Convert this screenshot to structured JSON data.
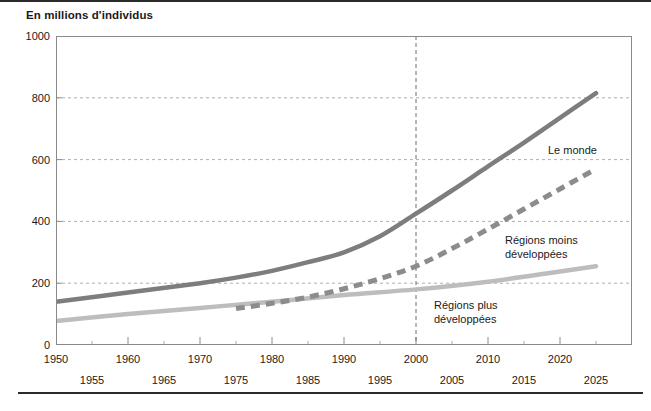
{
  "chart_data": {
    "type": "line",
    "title": "En millions d'individus",
    "xlabel": "",
    "ylabel": "",
    "xlim": [
      1950,
      2030
    ],
    "ylim": [
      0,
      1000
    ],
    "grid": true,
    "legend_position": "inline-annotations",
    "yticks": [
      0,
      200,
      400,
      600,
      800,
      1000
    ],
    "xticks_row_a": [
      1950,
      1960,
      1970,
      1980,
      1990,
      2000,
      2010,
      2020
    ],
    "xticks_row_b": [
      1955,
      1965,
      1975,
      1985,
      1995,
      2005,
      2015,
      2025
    ],
    "annotations": [
      {
        "text": "projection reference year",
        "x": 2000,
        "style": "vertical-dashed"
      }
    ],
    "series": [
      {
        "name": "Le monde",
        "label": "Le monde",
        "style": "solid",
        "color": "#7d7d7d",
        "x": [
          1950,
          1960,
          1970,
          1975,
          1980,
          1985,
          1990,
          1995,
          2000,
          2005,
          2010,
          2015,
          2020,
          2025
        ],
        "values": [
          140,
          170,
          200,
          218,
          240,
          268,
          300,
          352,
          425,
          500,
          578,
          655,
          735,
          815
        ]
      },
      {
        "name": "Régions moins développées",
        "label": "Régions moins\ndéveloppées",
        "style": "dashed",
        "color": "#8c8c8c",
        "x": [
          1975,
          1980,
          1985,
          1990,
          1995,
          2000,
          2005,
          2010,
          2015,
          2020,
          2025
        ],
        "values": [
          118,
          135,
          155,
          182,
          215,
          255,
          312,
          375,
          440,
          505,
          570
        ]
      },
      {
        "name": "Régions plus développées",
        "label": "Régions plus\ndéveloppées",
        "style": "solid",
        "color": "#bdbdbd",
        "x": [
          1950,
          1960,
          1970,
          1980,
          1990,
          2000,
          2010,
          2020,
          2025
        ],
        "values": [
          78,
          100,
          120,
          140,
          162,
          180,
          205,
          238,
          255
        ]
      }
    ],
    "series_label_positions": [
      {
        "name": "Le monde",
        "left": 548,
        "top": 143
      },
      {
        "name": "Régions moins développées",
        "left": 505,
        "top": 233
      },
      {
        "name": "Régions plus développées",
        "left": 434,
        "top": 298
      }
    ],
    "colors": {
      "world_line": "#7d7d7d",
      "less_developed_line": "#8c8c8c",
      "more_developed_line": "#bdbdbd",
      "grid": "#9a9a9a",
      "axis": "#8a8a8a",
      "text": "#1a1a1a",
      "rule": "#2b2b2b"
    }
  }
}
